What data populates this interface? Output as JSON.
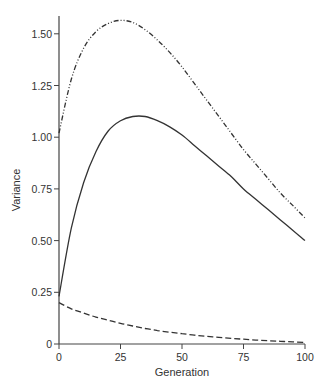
{
  "chart_data": {
    "type": "line",
    "title": "",
    "xlabel": "Generation",
    "ylabel": "Variance",
    "xlim": [
      0,
      100
    ],
    "ylim": [
      0,
      1.55
    ],
    "x_ticks": [
      0,
      25,
      50,
      75,
      100
    ],
    "x_tick_labels": [
      "0",
      "25",
      "50",
      "75",
      "100"
    ],
    "y_ticks": [
      0,
      0.25,
      0.5,
      0.75,
      1.0,
      1.25,
      1.5
    ],
    "y_tick_labels": [
      "0",
      "0.25",
      "0.50",
      "0.75",
      "1.00",
      "1.25",
      "1.50"
    ],
    "grid": false,
    "legend": null,
    "x": [
      0,
      5,
      10,
      15,
      20,
      25,
      30,
      35,
      40,
      45,
      50,
      55,
      60,
      65,
      70,
      75,
      80,
      85,
      90,
      95,
      100
    ],
    "series": [
      {
        "name": "dash-dot curve",
        "style": "dashdotdot",
        "values": [
          1.02,
          1.28,
          1.43,
          1.51,
          1.55,
          1.565,
          1.555,
          1.52,
          1.47,
          1.41,
          1.34,
          1.26,
          1.18,
          1.1,
          1.02,
          0.94,
          0.87,
          0.8,
          0.73,
          0.67,
          0.61
        ]
      },
      {
        "name": "solid curve",
        "style": "solid",
        "values": [
          0.23,
          0.56,
          0.78,
          0.93,
          1.03,
          1.08,
          1.1,
          1.1,
          1.08,
          1.05,
          1.01,
          0.96,
          0.91,
          0.86,
          0.81,
          0.75,
          0.7,
          0.65,
          0.6,
          0.55,
          0.5
        ]
      },
      {
        "name": "dashed curve",
        "style": "dashed",
        "values": [
          0.2,
          0.17,
          0.15,
          0.13,
          0.115,
          0.1,
          0.087,
          0.075,
          0.065,
          0.057,
          0.05,
          0.043,
          0.037,
          0.032,
          0.027,
          0.023,
          0.019,
          0.016,
          0.013,
          0.01,
          0.008
        ]
      }
    ]
  }
}
